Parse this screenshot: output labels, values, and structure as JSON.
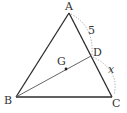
{
  "diagram": {
    "type": "triangle-geometry",
    "colors": {
      "line": "#2b2b2b",
      "segment_bd": "#555555",
      "dotted_arc": "#9a9a9a",
      "text": "#333333",
      "background": "#ffffff"
    },
    "points": {
      "A": {
        "label": "A",
        "x": 69,
        "y": 13
      },
      "B": {
        "label": "B",
        "x": 16,
        "y": 97
      },
      "C": {
        "label": "C",
        "x": 112,
        "y": 97
      },
      "D": {
        "label": "D",
        "x": 91,
        "y": 56
      },
      "G": {
        "label": "G",
        "x": 66,
        "y": 69
      }
    },
    "segments": [
      {
        "from": "A",
        "to": "B"
      },
      {
        "from": "A",
        "to": "C"
      },
      {
        "from": "B",
        "to": "C"
      },
      {
        "from": "B",
        "to": "D"
      }
    ],
    "measures": {
      "AD": {
        "label": "5"
      },
      "DC": {
        "label": "x"
      }
    }
  }
}
